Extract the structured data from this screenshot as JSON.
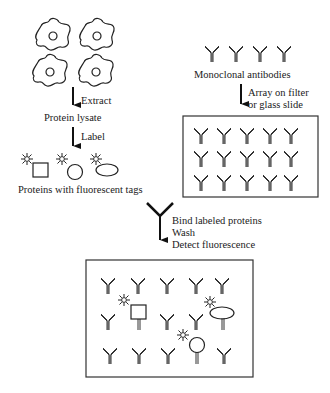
{
  "labels": {
    "extract": "Extract",
    "protein_lysate": "Protein lysate",
    "label": "Label",
    "proteins_tags": "Proteins with fluorescent tags",
    "monoclonal": "Monoclonal antibodies",
    "array_line1": "Array on filter",
    "array_line2": "or glass slide",
    "bind": "Bind labeled proteins",
    "wash": "Wash",
    "detect": "Detect fluorescence"
  },
  "colors": {
    "stroke": "#222222",
    "background": "#ffffff"
  }
}
